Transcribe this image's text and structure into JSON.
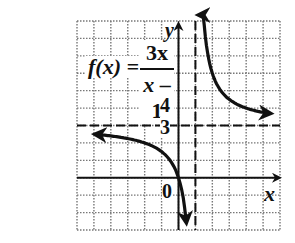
{
  "chart_data": {
    "type": "line",
    "function": {
      "name": "f(x)",
      "numerator": "3x",
      "denominator": "x - 1"
    },
    "xlabel": "x",
    "ylabel": "y",
    "origin_label": "0",
    "tick_labels": {
      "y": [
        "3",
        "4"
      ]
    },
    "grid": true,
    "grid_style": "dotted",
    "xlim": [
      -6,
      6
    ],
    "ylim": [
      -3,
      9
    ],
    "asymptotes": [
      {
        "type": "vertical",
        "value": 1,
        "style": "dashed"
      },
      {
        "type": "horizontal",
        "value": 3,
        "style": "dashed"
      }
    ],
    "series": [
      {
        "name": "left branch",
        "x": [
          -5.5,
          -4,
          -3,
          -2,
          -1,
          0,
          0.5
        ],
        "y": [
          2.54,
          2.4,
          2.25,
          2.0,
          1.5,
          0,
          -3
        ]
      },
      {
        "name": "right branch",
        "x": [
          1.4,
          1.5,
          2,
          3,
          4,
          5,
          5.5
        ],
        "y": [
          10.5,
          9,
          6,
          4.5,
          4,
          3.75,
          3.67
        ]
      }
    ]
  },
  "labels": {
    "fx": "f(x) =",
    "numerator": "3x",
    "denominator_var": "x",
    "denominator_rest": " – 1",
    "tick4": "4",
    "tick3": "3",
    "origin": "0",
    "y_axis": "y",
    "x_axis": "x"
  }
}
